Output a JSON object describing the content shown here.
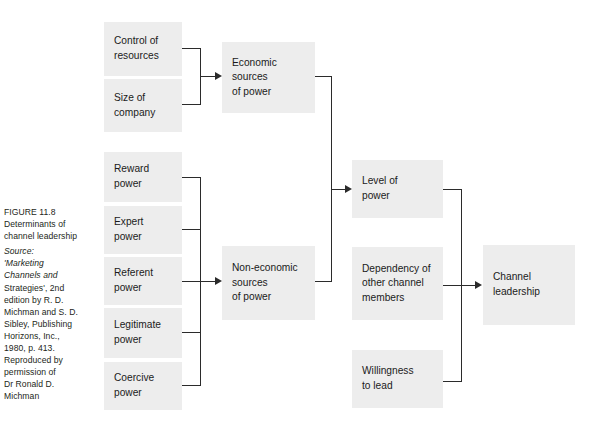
{
  "figure": {
    "caption_heading": [
      "FIGURE 11.8",
      "Determinants of",
      "channel leadership"
    ],
    "caption_source": [
      "Source:",
      "'Marketing",
      "Channels and",
      "Strategies', 2nd",
      "edition by R. D.",
      "Michman and S. D.",
      "Sibley, Publishing",
      "Horizons, Inc.,",
      "1980, p. 413.",
      "Reproduced by",
      "permission of",
      "Dr Ronald D.",
      "Michman"
    ]
  },
  "colors": {
    "node_fill": "#ededed",
    "line": "#2b2b2b",
    "text": "#1b1b1b",
    "page_background": "#ffffff"
  },
  "nodes": {
    "control_of_resources": [
      "Control of",
      "resources"
    ],
    "size_of_company": [
      "Size of",
      "company"
    ],
    "economic_sources": [
      "Economic",
      "sources",
      "of power"
    ],
    "reward_power": [
      "Reward",
      "power"
    ],
    "expert_power": [
      "Expert",
      "power"
    ],
    "referent_power": [
      "Referent",
      "power"
    ],
    "legitimate_power": [
      "Legitimate",
      "power"
    ],
    "coercive_power": [
      "Coercive",
      "power"
    ],
    "non_economic_sources": [
      "Non-economic",
      "sources",
      "of power"
    ],
    "level_of_power": [
      "Level of",
      "power"
    ],
    "dependency_other_members": [
      "Dependency of",
      "other channel",
      "members"
    ],
    "willingness_to_lead": [
      "Willingness",
      "to lead"
    ],
    "channel_leadership": [
      "Channel",
      "leadership"
    ]
  },
  "edges": [
    "control-of-resources -> economic-sources",
    "size-of-company -> economic-sources",
    "reward-power -> non-economic-sources",
    "expert-power -> non-economic-sources",
    "referent-power -> non-economic-sources",
    "legitimate-power -> non-economic-sources",
    "coercive-power -> non-economic-sources",
    "economic-sources -> level-of-power",
    "non-economic-sources -> level-of-power",
    "level-of-power -> channel-leadership",
    "dependency-other-members -> channel-leadership",
    "willingness-to-lead -> channel-leadership"
  ]
}
